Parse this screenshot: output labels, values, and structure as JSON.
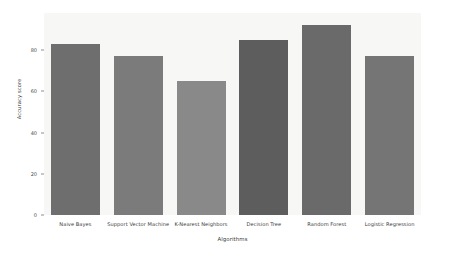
{
  "chart_data": {
    "type": "bar",
    "title": "",
    "xlabel": "Algorithms",
    "ylabel": "Accuracy score",
    "categories": [
      "Naive Bayes",
      "Support Vector Machine",
      "K-Nearest Neighbors",
      "Decision Tree",
      "Random Forest",
      "Logistic Regression"
    ],
    "values": [
      83,
      77,
      65,
      85,
      92,
      77
    ],
    "ylim": [
      0,
      98
    ],
    "yticks": [
      0,
      20,
      40,
      60,
      80
    ],
    "ytick_labels": [
      "0",
      "20",
      "40",
      "60",
      "80"
    ],
    "grid": false,
    "legend": "none",
    "bar_colors": [
      "#6e6e6e",
      "#7b7b7b",
      "#898989",
      "#5d5d5d",
      "#6a6a6a",
      "#757575"
    ],
    "background_color": "#f7f7f6",
    "figure_color": "#ffffff"
  }
}
